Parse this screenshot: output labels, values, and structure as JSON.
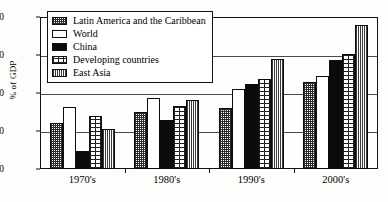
{
  "chart_data": {
    "type": "bar",
    "title": "",
    "xlabel": "",
    "ylabel": "% of GDP",
    "ylim": [
      0,
      40
    ],
    "yticks": [
      0,
      10,
      20,
      30,
      40
    ],
    "ytick_labels": [
      "0",
      "10",
      "20",
      "30",
      "40"
    ],
    "grid": true,
    "legend_position": "upper-left-inside",
    "categories": [
      "1970's",
      "1980's",
      "1990's",
      "2000's"
    ],
    "series": [
      {
        "name": "Latin America and the Caribbean",
        "pattern": "fine-checker",
        "values": [
          12.2,
          15.1,
          16.0,
          22.8
        ]
      },
      {
        "name": "World",
        "pattern": "white",
        "values": [
          16.4,
          18.7,
          21.0,
          24.4
        ]
      },
      {
        "name": "China",
        "pattern": "solid-black",
        "values": [
          4.8,
          13.0,
          22.4,
          28.8
        ]
      },
      {
        "name": "Developing countries",
        "pattern": "brick",
        "values": [
          14.0,
          16.7,
          23.7,
          30.2
        ]
      },
      {
        "name": "East Asia",
        "pattern": "vertical-stripes",
        "values": [
          10.5,
          18.1,
          29.0,
          37.9
        ]
      }
    ]
  },
  "colors": {
    "axis": "#111111",
    "grid": "#4a4a4a",
    "plot_background": "#fefefe",
    "page_background": "#ffffff"
  }
}
